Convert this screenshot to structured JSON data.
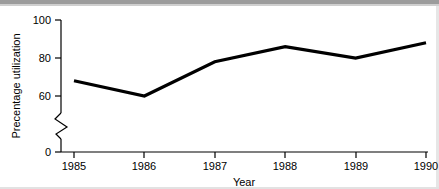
{
  "chart_data": {
    "type": "line",
    "title": "",
    "xlabel": "Year",
    "ylabel": "Precentage utilization",
    "categories": [
      "1985",
      "1986",
      "1987",
      "1988",
      "1989",
      "1990"
    ],
    "x": [
      1985,
      1986,
      1987,
      1988,
      1989,
      1990
    ],
    "values": [
      68,
      60,
      78,
      86,
      80,
      88
    ],
    "series": [
      {
        "name": "Precentage utilization",
        "values": [
          68,
          60,
          78,
          86,
          80,
          88
        ],
        "color": "#000000"
      }
    ],
    "ylim": [
      0,
      100
    ],
    "xlim": [
      1985,
      1990
    ],
    "ytick_labels": [
      "0",
      "60",
      "80",
      "100"
    ],
    "yticks": [
      0,
      60,
      80,
      100
    ],
    "xtick_labels": [
      "1985",
      "1986",
      "1987",
      "1988",
      "1989",
      "1990"
    ],
    "axis_break": true,
    "axis_break_between": [
      0,
      60
    ],
    "grid": false,
    "legend": false,
    "legend_position": "none",
    "markers": false,
    "background_color": "#ffffff",
    "line_color": "#000000"
  },
  "axis": {
    "y_title": "Precentage utilization",
    "x_title": "Year",
    "y_ticks": [
      {
        "label": "100",
        "value": 100
      },
      {
        "label": "80",
        "value": 80
      },
      {
        "label": "60",
        "value": 60
      },
      {
        "label": "0",
        "value": 0
      }
    ],
    "x_ticks": [
      {
        "label": "1985",
        "value": 1985
      },
      {
        "label": "1986",
        "value": 1986
      },
      {
        "label": "1987",
        "value": 1987
      },
      {
        "label": "1988",
        "value": 1988
      },
      {
        "label": "1989",
        "value": 1989
      },
      {
        "label": "1990",
        "value": 1990
      }
    ]
  },
  "icons": {
    "axis_break": "axis-break-zigzag-icon"
  }
}
